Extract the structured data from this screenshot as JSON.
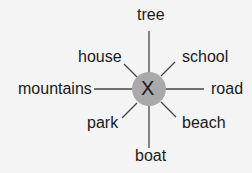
{
  "diagram": {
    "type": "word-web",
    "center": {
      "label": "X",
      "fill": "#a9a9a9"
    },
    "line_color": "#444444",
    "spokes": [
      {
        "direction": "north",
        "label": "tree"
      },
      {
        "direction": "northeast",
        "label": "school"
      },
      {
        "direction": "east",
        "label": "road"
      },
      {
        "direction": "southeast",
        "label": "beach"
      },
      {
        "direction": "south",
        "label": "boat"
      },
      {
        "direction": "southwest",
        "label": "park"
      },
      {
        "direction": "west",
        "label": "mountains"
      },
      {
        "direction": "northwest",
        "label": "house"
      }
    ]
  }
}
